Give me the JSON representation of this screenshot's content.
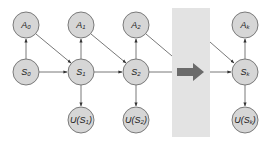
{
  "diagram": {
    "type": "dynamic-decision-network",
    "colors": {
      "node_fill": "#d6d6d6",
      "node_stroke": "#7a7a7a",
      "edge": "#555555",
      "band": "#e3e3e3",
      "big_arrow": "#6b6b6b"
    },
    "nodes": [
      {
        "id": "A0",
        "label": "A",
        "sub": "0",
        "x": 26,
        "y": 25
      },
      {
        "id": "S0",
        "label": "S",
        "sub": "0",
        "x": 26,
        "y": 72
      },
      {
        "id": "A1",
        "label": "A",
        "sub": "1",
        "x": 81,
        "y": 25
      },
      {
        "id": "S1",
        "label": "S",
        "sub": "1",
        "x": 81,
        "y": 72
      },
      {
        "id": "US1",
        "label": "U(S",
        "sub": "1",
        "suffix": ")",
        "x": 81,
        "y": 120
      },
      {
        "id": "A2",
        "label": "A",
        "sub": "2",
        "x": 136,
        "y": 25
      },
      {
        "id": "S2",
        "label": "S",
        "sub": "2",
        "x": 136,
        "y": 72
      },
      {
        "id": "US2",
        "label": "U(S",
        "sub": "2",
        "suffix": ")",
        "x": 136,
        "y": 120
      },
      {
        "id": "Ak",
        "label": "A",
        "sub": "k",
        "x": 245,
        "y": 25
      },
      {
        "id": "Sk",
        "label": "S",
        "sub": "k",
        "x": 245,
        "y": 72
      },
      {
        "id": "USk",
        "label": "U(S",
        "sub": "k",
        "suffix": ")",
        "x": 245,
        "y": 120
      }
    ],
    "edges": [
      [
        "S0",
        "A0"
      ],
      [
        "S0",
        "S1"
      ],
      [
        "A0",
        "S1"
      ],
      [
        "S1",
        "A1"
      ],
      [
        "S1",
        "S2"
      ],
      [
        "A1",
        "S2"
      ],
      [
        "S1",
        "US1"
      ],
      [
        "S2",
        "A2"
      ],
      [
        "S2",
        "US2"
      ],
      [
        "Sk",
        "Ak"
      ],
      [
        "Sk",
        "USk"
      ]
    ],
    "ellipsis": "continuation-arrow"
  }
}
